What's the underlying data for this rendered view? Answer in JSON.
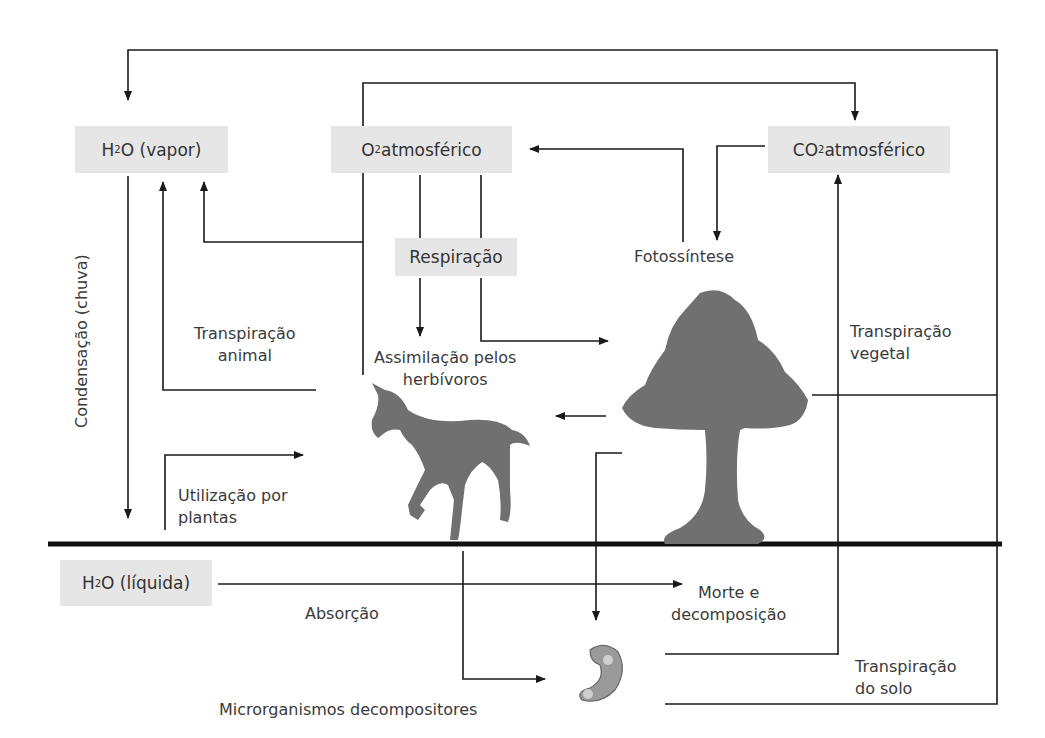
{
  "boxes": {
    "h2o_vapor": {
      "pre": "H",
      "sub": "2",
      "post": "O (vapor)"
    },
    "o2": {
      "pre": "O",
      "sub": "2",
      "post": " atmosférico"
    },
    "co2": {
      "pre": "CO",
      "sub": "2",
      "post": " atmosférico"
    },
    "respiracao": "Respiração",
    "h2o_liquida": {
      "pre": "H",
      "sub": "2",
      "post": "O (líquida)"
    }
  },
  "labels": {
    "fotossintese": "Fotossíntese",
    "transp_animal_1": "Transpiração",
    "transp_animal_2": "animal",
    "assim_1": "Assimilação pelos",
    "assim_2": "herbívoros",
    "transp_vegetal_1": "Transpiração",
    "transp_vegetal_2": "vegetal",
    "condensacao": "Condensação (chuva)",
    "utilizacao_1": "Utilização por",
    "utilizacao_2": "plantas",
    "absorcao": "Absorção",
    "morte_1": "Morte e",
    "morte_2": "decomposição",
    "transp_solo_1": "Transpiração",
    "transp_solo_2": "do solo",
    "microrganismos": "Microrganismos decompositores"
  },
  "icons": [
    "horse-silhouette",
    "tree-silhouette",
    "bacterium-icon"
  ],
  "colors": {
    "box_bg": "#e6e6e6",
    "line": "#1a1a1a",
    "silhouette": "#6f6f6f"
  }
}
